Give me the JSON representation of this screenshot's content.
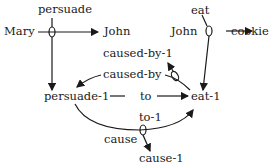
{
  "diagram": {
    "nodes": {
      "mary": "Mary",
      "john1": "John",
      "john2": "John",
      "cookie": "cookie",
      "persuade1": "persuade-1",
      "eat1": "eat-1",
      "cause1": "cause-1"
    },
    "relations": {
      "persuade": "persuade",
      "eat": "eat",
      "caused_by_1": "caused-by-1",
      "caused_by": "caused-by",
      "to": "to",
      "to_1": "to-1",
      "cause": "cause"
    },
    "colors": {
      "ink": "#1a1a1a",
      "background": "#ffffff"
    }
  }
}
